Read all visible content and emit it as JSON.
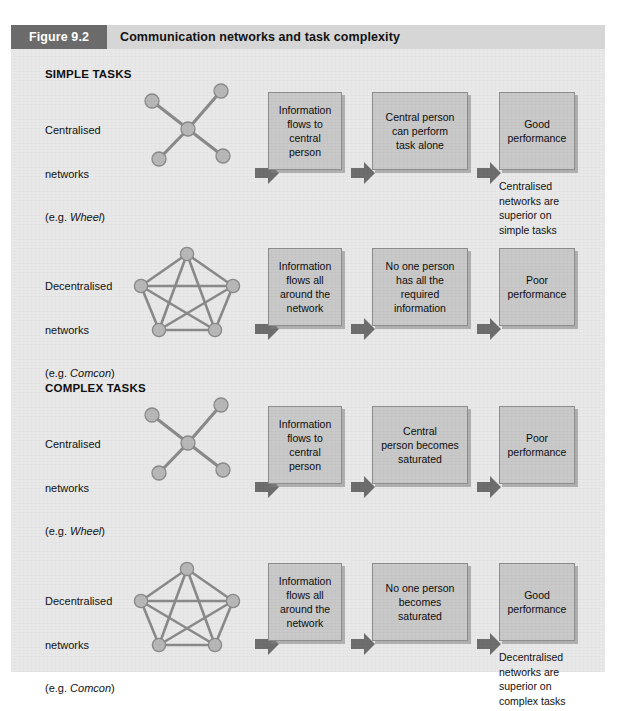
{
  "figure": {
    "tag": "Figure 9.2",
    "title": "Communication networks and task complexity"
  },
  "sections": [
    {
      "id": "simple",
      "heading": "SIMPLE TASKS"
    },
    {
      "id": "complex",
      "heading": "COMPLEX TASKS"
    }
  ],
  "rows": [
    {
      "id": "simple-centralised",
      "label_line1": "Centralised",
      "label_line2": "networks",
      "label_line3_prefix": "(e.g. ",
      "label_line3_italic": "Wheel",
      "label_line3_suffix": ")",
      "network": "wheel",
      "boxes": [
        "Information\nflows to\ncentral\nperson",
        "Central person\ncan perform\ntask alone",
        "Good\nperformance"
      ],
      "note": "Centralised\nnetworks are\nsuperior on\nsimple tasks"
    },
    {
      "id": "simple-decentralised",
      "label_line1": "Decentralised",
      "label_line2": "networks",
      "label_line3_prefix": "(e.g. ",
      "label_line3_italic": "Comcon",
      "label_line3_suffix": ")",
      "network": "comcon",
      "boxes": [
        "Information\nflows all\naround the\nnetwork",
        "No one person\nhas all the\nrequired\ninformation",
        "Poor\nperformance"
      ],
      "note": ""
    },
    {
      "id": "complex-centralised",
      "label_line1": "Centralised",
      "label_line2": "networks",
      "label_line3_prefix": "(e.g. ",
      "label_line3_italic": "Wheel",
      "label_line3_suffix": ")",
      "network": "wheel",
      "boxes": [
        "Information\nflows to\ncentral\nperson",
        "Central\nperson becomes\nsaturated",
        "Poor\nperformance"
      ],
      "note": ""
    },
    {
      "id": "complex-decentralised",
      "label_line1": "Decentralised",
      "label_line2": "networks",
      "label_line3_prefix": "(e.g. ",
      "label_line3_italic": "Comcon",
      "label_line3_suffix": ")",
      "network": "comcon",
      "boxes": [
        "Information\nflows all\naround the\nnetwork",
        "No one person\nbecomes\nsaturated",
        "Good\nperformance"
      ],
      "note": "Decentralised\nnetworks are\nsuperior on\ncomplex tasks"
    }
  ],
  "colors": {
    "header_tag_bg": "#6b6b6b",
    "header_bar_bg": "#d6d6d6",
    "panel_bg": "#e9e9e9",
    "box_bg": "#c9c9c9",
    "box_border": "#8e8e8e",
    "arrow_fill": "#6e6e6e",
    "node_fill": "#b6b6b6",
    "edge_stroke": "#888888",
    "text": "#111111"
  }
}
